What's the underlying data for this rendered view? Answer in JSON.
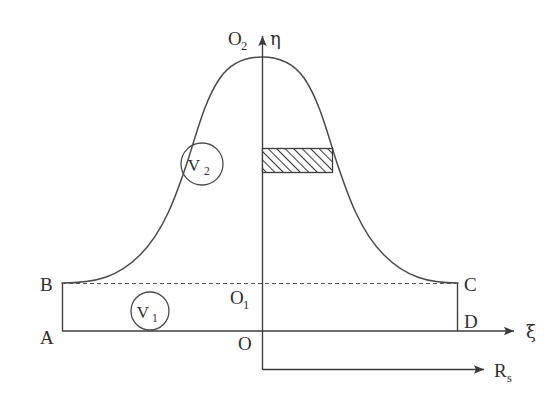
{
  "figure": {
    "kind": "schematic-diagram",
    "background_color": "#ffffff",
    "line_color": "#3c3c3c",
    "curve_color": "#4a4a4a"
  },
  "axes": {
    "vertical": {
      "name": "eta-axis",
      "label": "η",
      "direction": "up"
    },
    "horizontal_upper": {
      "name": "xi-axis",
      "label": "ξ",
      "direction": "right"
    },
    "horizontal_lower": {
      "name": "rs-axis",
      "label": "R",
      "label_sub": "s",
      "direction": "right"
    }
  },
  "points": [
    {
      "id": "A",
      "label": "A",
      "desc": "lower-left corner of control volume"
    },
    {
      "id": "B",
      "label": "B",
      "desc": "upper-left corner of control volume"
    },
    {
      "id": "C",
      "label": "C",
      "desc": "upper-right corner of control volume"
    },
    {
      "id": "D",
      "label": "D",
      "desc": "lower-right corner of control volume"
    },
    {
      "id": "O",
      "label": "O",
      "desc": "origin on lower boundary AD"
    },
    {
      "id": "O1",
      "label": "O",
      "label_sub": "1",
      "desc": "origin on dashed boundary BC"
    },
    {
      "id": "O2",
      "label": "O",
      "label_sub": "2",
      "desc": "apex of bell curve on eta axis"
    }
  ],
  "regions": [
    {
      "id": "V1",
      "label": "V",
      "label_sub": "1",
      "desc": "lower rectangular region between AD and BC"
    },
    {
      "id": "V2",
      "label": "V",
      "label_sub": "2",
      "desc": "upper region bounded by bell curve above BC"
    }
  ],
  "hatched_band": {
    "name": "hatched-strip",
    "desc": "cross-hatched horizontal strip from eta axis to right branch of curve",
    "fill_pattern": "diagonal-hatch-45",
    "hatch_color": "#3c3c3c",
    "fill_color": "#ffffff"
  },
  "curve": {
    "name": "bell-curve",
    "shape": "gaussian-like bell, symmetric about eta axis, asymptotic to BC at B and C"
  }
}
